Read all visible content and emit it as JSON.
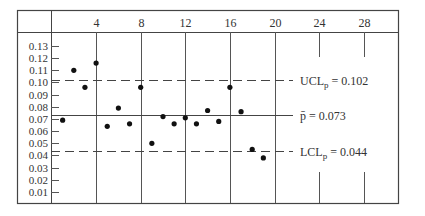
{
  "chart_data": {
    "type": "scatter",
    "title": "",
    "xlabel": "",
    "ylabel": "",
    "x_tick_labels": [
      "4",
      "8",
      "12",
      "16",
      "20",
      "24",
      "28"
    ],
    "x_ticks": [
      4,
      8,
      12,
      16,
      20,
      24,
      28
    ],
    "y_tick_labels": [
      "0.13",
      "0.12",
      "0.11",
      "0.10",
      "0.09",
      "0.08",
      "0.07",
      "0.06",
      "0.05",
      "0.04",
      "0.03",
      "0.02",
      "0.01"
    ],
    "y_ticks": [
      0.13,
      0.12,
      0.11,
      0.1,
      0.09,
      0.08,
      0.07,
      0.06,
      0.05,
      0.04,
      0.03,
      0.02,
      0.01
    ],
    "xlim": [
      0,
      31
    ],
    "ylim": [
      0,
      0.14
    ],
    "grid": "vertical lines at 4, 8, 12, 16, 20 (full height); short ticks at 24 and 28",
    "series": [
      {
        "name": "sample proportion",
        "x": [
          1,
          2,
          3,
          4,
          5,
          6,
          7,
          8,
          9,
          10,
          11,
          12,
          13,
          14,
          15,
          16,
          17,
          18,
          19
        ],
        "values": [
          0.069,
          0.11,
          0.096,
          0.116,
          0.064,
          0.079,
          0.066,
          0.096,
          0.05,
          0.072,
          0.066,
          0.071,
          0.066,
          0.077,
          0.068,
          0.096,
          0.076,
          0.045,
          0.038
        ]
      }
    ],
    "reference_lines": [
      {
        "name": "UCL",
        "label_main": "UCL",
        "label_sub": "p",
        "label_rest": " = 0.102",
        "value": 0.102,
        "style": "dashed"
      },
      {
        "name": "center",
        "label_main": "p̄",
        "label_sub": "",
        "label_rest": " = 0.073",
        "value": 0.073,
        "style": "solid"
      },
      {
        "name": "LCL",
        "label_main": "LCL",
        "label_sub": "p",
        "label_rest": " = 0.044",
        "value": 0.044,
        "style": "dashed"
      }
    ],
    "legend": "none"
  }
}
